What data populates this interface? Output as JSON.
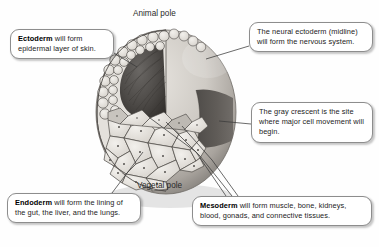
{
  "figure": {
    "poles": {
      "animal": "Animal pole",
      "vegetal": "Vegetal pole"
    }
  },
  "callouts": {
    "ectoderm": {
      "term": "Ectoderm",
      "text": " will form epidermal layer of skin.",
      "full": "Ectoderm will form epidermal layer of skin."
    },
    "neural": {
      "term": "",
      "text": "The neural ectoderm (midline) will form the nervous system.",
      "full": "The neural ectoderm (midline) will form the nervous system."
    },
    "crescent": {
      "term": "",
      "text": "The gray crescent is the site where major cell movement will begin.",
      "full": "The gray crescent is the site where major cell movement will begin."
    },
    "endoderm": {
      "term": "Endoderm",
      "text": " will form the lining of the gut, the liver, and the lungs.",
      "full": "Endoderm will form the lining of the gut, the liver, and the lungs."
    },
    "mesoderm": {
      "term": "Mesoderm",
      "text": " will form muscle, bone, kidneys, blood, gonads, and connective tissues.",
      "full": "Mesoderm will form muscle, bone, kidneys, blood, gonads, and connective tissues."
    }
  },
  "colors": {
    "box_border": "#8d8d8d",
    "box_fill": "#ffffff",
    "text": "#1b1b1b",
    "leader_line": "#3a3a3a",
    "sphere_light": "#dedbd6",
    "sphere_mid": "#b8b4ae",
    "sphere_shadow": "#8a8680",
    "gray_crescent": "#55514d",
    "blastocoel_dark": "#4a4744",
    "cell_fill": "#e9e6e1",
    "cell_stroke": "#4f4c49",
    "background": "#fefefe"
  },
  "structures": {
    "blastocoel": "blastocoel-cavity",
    "gray_crescent": "gray-crescent-band",
    "animal_cells": "small-animal-pole-cells",
    "vegetal_cells": "large-yolky-vegetal-cells"
  }
}
